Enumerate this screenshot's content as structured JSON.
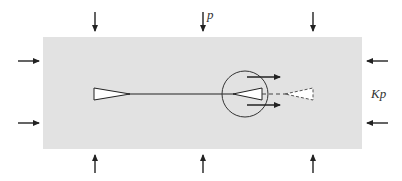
{
  "diagram": {
    "type": "crack-under-biaxial-load",
    "colors": {
      "plate": "#e2e2e2",
      "stroke": "#222222",
      "crack_fill": "#ffffff"
    },
    "labels": {
      "vertical_load": "p",
      "horizontal_load": "Kp"
    },
    "arrows": {
      "top_count": 3,
      "bottom_count": 3,
      "left_count": 2,
      "right_count": 2,
      "crack_tip_arrows": 2
    }
  }
}
